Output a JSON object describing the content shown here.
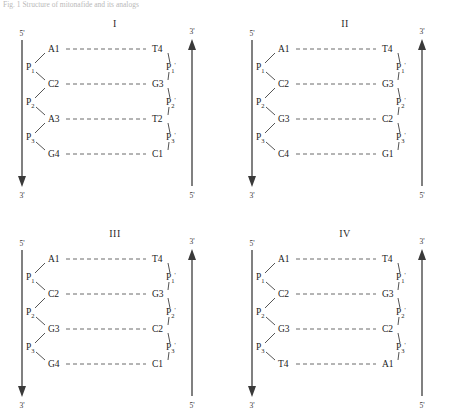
{
  "figure": {
    "caption": "Fig. 1  Structure of mitonafide and its analogs",
    "caption_faint": true
  },
  "labels": {
    "five_prime": "5'",
    "three_prime": "3'",
    "phosphate_left": [
      "P1",
      "P2",
      "P3"
    ],
    "phosphate_right": [
      "P1'",
      "P2'",
      "P3'"
    ],
    "phosphate_base": "P",
    "phosphate_subs": [
      "1",
      "2",
      "3"
    ],
    "prime_mark": "'"
  },
  "panels": [
    {
      "id": "panel-I",
      "label": "I",
      "left_strand": {
        "five_end": "5'",
        "three_end": "3'",
        "direction": "down"
      },
      "right_strand": {
        "three_end": "3'",
        "five_end": "5'",
        "direction": "up"
      },
      "base_pairs": [
        {
          "left": "A1",
          "right": "T4"
        },
        {
          "left": "C2",
          "right": "G3"
        },
        {
          "left": "A3",
          "right": "T2"
        },
        {
          "left": "G4",
          "right": "C1"
        }
      ]
    },
    {
      "id": "panel-II",
      "label": "II",
      "left_strand": {
        "five_end": "5'",
        "three_end": "3'",
        "direction": "down"
      },
      "right_strand": {
        "three_end": "3'",
        "five_end": "5'",
        "direction": "up"
      },
      "base_pairs": [
        {
          "left": "A1",
          "right": "T4"
        },
        {
          "left": "C2",
          "right": "G3"
        },
        {
          "left": "G3",
          "right": "C2"
        },
        {
          "left": "C4",
          "right": "G1"
        }
      ]
    },
    {
      "id": "panel-III",
      "label": "III",
      "left_strand": {
        "five_end": "5'",
        "three_end": "3'",
        "direction": "down"
      },
      "right_strand": {
        "three_end": "3'",
        "five_end": "5'",
        "direction": "up"
      },
      "base_pairs": [
        {
          "left": "A1",
          "right": "T4"
        },
        {
          "left": "C2",
          "right": "G3"
        },
        {
          "left": "G3",
          "right": "C2"
        },
        {
          "left": "G4",
          "right": "C1"
        }
      ]
    },
    {
      "id": "panel-IV",
      "label": "IV",
      "left_strand": {
        "five_end": "5'",
        "three_end": "3'",
        "direction": "down"
      },
      "right_strand": {
        "three_end": "3'",
        "five_end": "5'",
        "direction": "up"
      },
      "base_pairs": [
        {
          "left": "A1",
          "right": "T4"
        },
        {
          "left": "C2",
          "right": "G3"
        },
        {
          "left": "G3",
          "right": "C2"
        },
        {
          "left": "T4",
          "right": "A1"
        }
      ]
    }
  ]
}
